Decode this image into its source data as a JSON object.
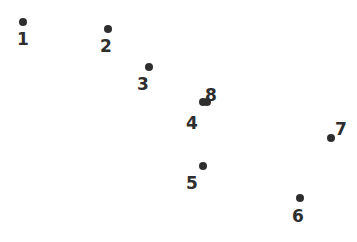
{
  "figure": {
    "title": "",
    "background_color": "#ffffff",
    "width": 357,
    "height": 242
  },
  "chart_data": {
    "type": "scatter",
    "title": "",
    "xlabel": "",
    "ylabel": "",
    "grid": false,
    "legend": "none",
    "axes_visible": false,
    "marker": {
      "shape": "circle",
      "color": "#2e2e2e",
      "diameter_px": 8
    },
    "label_style": {
      "color": "#2e2e2e",
      "font_size_px": 17,
      "font_weight": "600"
    },
    "xlim": [
      0,
      357
    ],
    "ylim": [
      242,
      0
    ],
    "point_count": 8,
    "labels": [
      "1",
      "2",
      "3",
      "4",
      "5",
      "6",
      "7",
      "8"
    ],
    "x": [
      23,
      108,
      149,
      203,
      203,
      300,
      331,
      207
    ],
    "y": [
      22,
      29,
      67,
      102,
      166,
      198,
      138,
      102
    ],
    "points": [
      {
        "label": "1",
        "x": 23,
        "y": 22,
        "label_x": 23,
        "label_y": 39
      },
      {
        "label": "2",
        "x": 108,
        "y": 29,
        "label_x": 106,
        "label_y": 46
      },
      {
        "label": "3",
        "x": 149,
        "y": 67,
        "label_x": 143,
        "label_y": 84
      },
      {
        "label": "4",
        "x": 203,
        "y": 102,
        "label_x": 192,
        "label_y": 123
      },
      {
        "label": "5",
        "x": 203,
        "y": 166,
        "label_x": 192,
        "label_y": 183
      },
      {
        "label": "6",
        "x": 300,
        "y": 198,
        "label_x": 298,
        "label_y": 216
      },
      {
        "label": "7",
        "x": 331,
        "y": 138,
        "label_x": 341,
        "label_y": 129
      },
      {
        "label": "8",
        "x": 207,
        "y": 102,
        "label_x": 211,
        "label_y": 95
      }
    ]
  }
}
